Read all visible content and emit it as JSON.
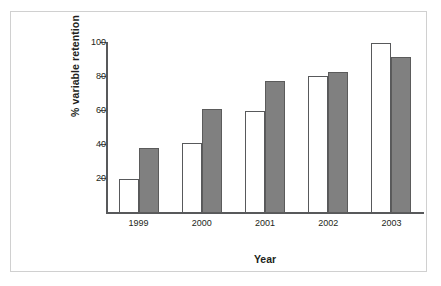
{
  "chart_data": {
    "type": "bar",
    "title": "",
    "subtitle": "",
    "xlabel": "Year",
    "ylabel": "% variable retention",
    "categories": [
      "1999",
      "2000",
      "2001",
      "2002",
      "2003"
    ],
    "series": [
      {
        "name": "series-1",
        "color": "#ffffff",
        "values": [
          20,
          41,
          60,
          80.5,
          100
        ]
      },
      {
        "name": "series-2",
        "color": "#808080",
        "values": [
          38.5,
          61,
          77.5,
          83,
          92
        ]
      }
    ],
    "ylim": [
      0,
      100
    ],
    "yticks": [
      20,
      40,
      60,
      80,
      100
    ],
    "ytick_labels": [
      "20",
      "40",
      "60",
      "80",
      "100"
    ],
    "grid": false,
    "legend": "none",
    "axis_color": "#58595b",
    "frame_color": "#d0d0d0",
    "text_color": "#231f20"
  },
  "axes": {
    "y_title": "% variable retention",
    "x_title": "Year",
    "tick_100": "100",
    "tick_80": "80",
    "tick_60": "60",
    "tick_40": "40",
    "tick_20": "20"
  },
  "categories": {
    "c0": "1999",
    "c1": "2000",
    "c2": "2001",
    "c3": "2002",
    "c4": "2003"
  }
}
